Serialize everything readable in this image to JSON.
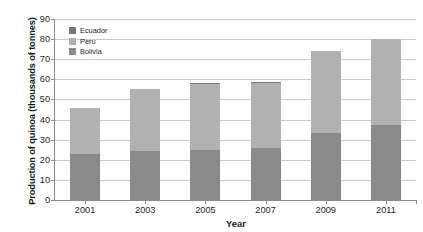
{
  "chart_data": {
    "type": "bar",
    "title": "",
    "subtitle": "",
    "xlabel": "Year",
    "ylabel": "Production of quinoa (thousands of tonnes)",
    "categories": [
      "2001",
      "2003",
      "2005",
      "2007",
      "2009",
      "2011"
    ],
    "series": [
      {
        "name": "Bolivia",
        "color": "#8a8a8a",
        "values": [
          23.0,
          24.5,
          25.0,
          26.0,
          33.5,
          37.5
        ]
      },
      {
        "name": "Peru",
        "color": "#b1b1b1",
        "values": [
          23.0,
          30.5,
          32.5,
          32.0,
          40.5,
          42.5
        ]
      },
      {
        "name": "Ecuador",
        "color": "#777777",
        "values": [
          0.0,
          0.0,
          0.6,
          0.6,
          0.0,
          0.0
        ]
      }
    ],
    "stacked": true,
    "stack_totals": [
      46.0,
      55.0,
      58.1,
      58.6,
      74.0,
      80.0
    ],
    "ylim": [
      0,
      90
    ],
    "yticks": [
      0,
      10,
      20,
      30,
      40,
      50,
      60,
      70,
      80,
      90
    ],
    "ytick_labels": [
      "0",
      "10",
      "20",
      "30",
      "40",
      "50",
      "60",
      "70",
      "80",
      "90"
    ],
    "grid": true,
    "grid_axis": "y",
    "legend_position": "top-left-inside",
    "legend_order": [
      "Ecuador",
      "Peru",
      "Bolivia"
    ]
  },
  "axes": {
    "y_title": "Production of quinoa (thousands of tonnes)",
    "x_title": "Year"
  },
  "legend": {
    "entries": [
      {
        "label": "Ecuador",
        "color": "#777777"
      },
      {
        "label": "Peru",
        "color": "#b1b1b1"
      },
      {
        "label": "Bolivia",
        "color": "#8a8a8a"
      }
    ]
  },
  "colors": {
    "bolivia": "#8a8a8a",
    "peru": "#b1b1b1",
    "ecuador": "#777777",
    "gridline": "#c9c9c9",
    "axis": "#8c8c8c",
    "text": "#231f20",
    "background": "#ffffff"
  }
}
